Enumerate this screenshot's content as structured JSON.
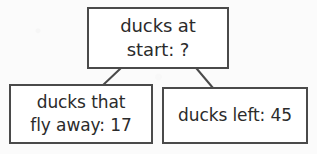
{
  "diagram": {
    "type": "part-whole-bar-model",
    "background_color": "#fbfbfb",
    "box_fill_color": "#ffffff",
    "box_border_color": "#4a4a4a",
    "text_color": "#2b2b2b",
    "connector_color": "#4a4a4a",
    "nodes": {
      "total": {
        "role": "whole",
        "line1": "ducks at",
        "line2": "start: ?",
        "value": "?"
      },
      "part_left": {
        "role": "part",
        "line1": "ducks that",
        "line2": "fly away: 17",
        "value": "17"
      },
      "part_right": {
        "role": "part",
        "line1": "ducks left: 45",
        "line2": "",
        "value": "45"
      }
    },
    "connectors": [
      {
        "name": "connector-total-to-left",
        "from": [
          120,
          69
        ],
        "to": [
          103,
          85
        ]
      },
      {
        "name": "connector-total-to-right",
        "from": [
          197,
          69
        ],
        "to": [
          213,
          88
        ]
      }
    ]
  }
}
